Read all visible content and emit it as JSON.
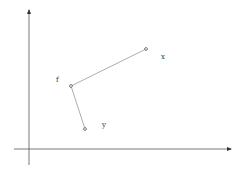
{
  "diagram": {
    "type": "coordinate-plot",
    "background": "#ffffff",
    "axes": {
      "origin": {
        "x": 29,
        "y": 149
      },
      "y_axis": {
        "x": 29,
        "top": 10,
        "bottom": 165
      },
      "x_axis": {
        "y": 149,
        "left": 14,
        "right": 231
      },
      "color": "#555555"
    },
    "points": [
      {
        "id": "f",
        "label": "f",
        "x": 71,
        "y": 86,
        "label_x": 56,
        "label_y": 82
      },
      {
        "id": "x",
        "label": "x",
        "x": 146,
        "y": 49,
        "label_x": 161,
        "label_y": 59
      },
      {
        "id": "y",
        "label": "y",
        "x": 85,
        "y": 129,
        "label_x": 102,
        "label_y": 127
      }
    ],
    "edges": [
      {
        "from": "f",
        "to": "x"
      },
      {
        "from": "f",
        "to": "y"
      }
    ],
    "edge_color": "#8a8a8a"
  }
}
